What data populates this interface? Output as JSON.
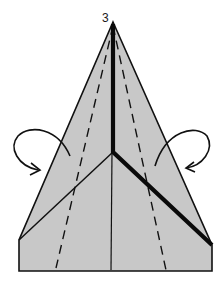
{
  "diagram": {
    "step_number": "3",
    "colors": {
      "paper_fill": "#c8c8c8",
      "outline": "#111111",
      "background": "#ffffff"
    },
    "elements": [
      {
        "type": "paper-shape",
        "description": "Pentagonal folded paper with pointed top"
      },
      {
        "type": "thick-fold-line",
        "description": "Vertical valley from apex to center, then diagonal to right corner"
      },
      {
        "type": "thin-fold-line",
        "description": "Diagonal from center to left corner"
      },
      {
        "type": "center-crease",
        "description": "Vertical crease below center"
      },
      {
        "type": "dashed-fold-line-left",
        "description": "Dashed fold line left of center"
      },
      {
        "type": "dashed-fold-line-right",
        "description": "Dashed fold line right of center"
      },
      {
        "type": "fold-arrow-left",
        "description": "Curved arrow indicating left flap fold behind"
      },
      {
        "type": "fold-arrow-right",
        "description": "Curved arrow indicating right flap fold behind"
      }
    ]
  }
}
